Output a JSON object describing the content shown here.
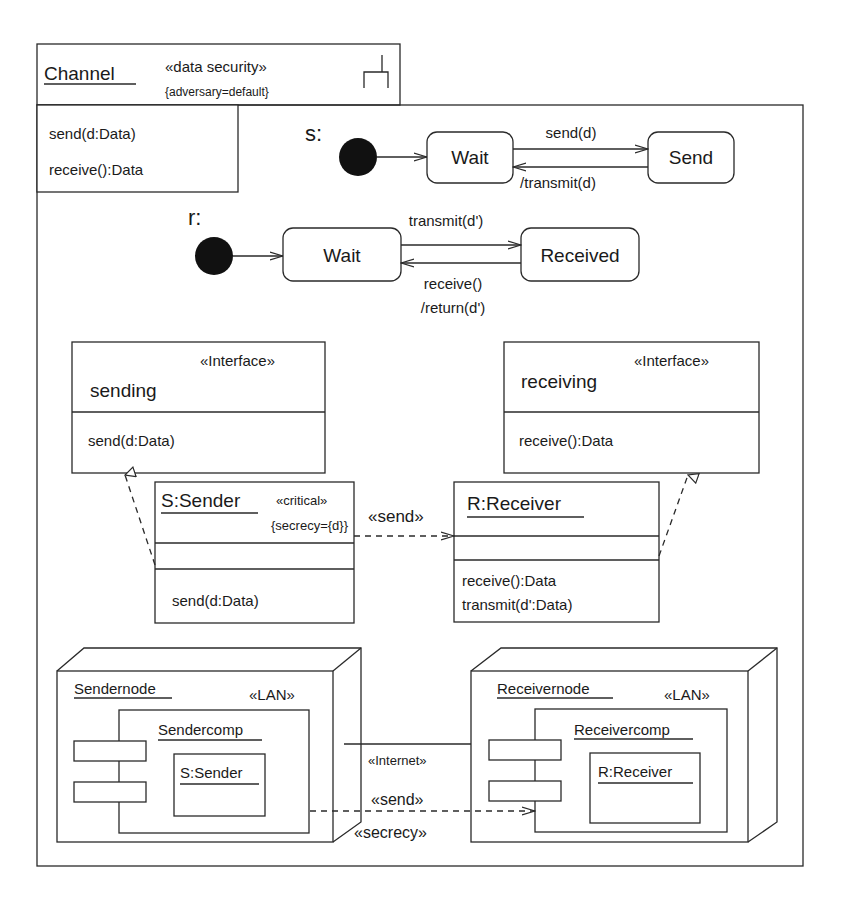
{
  "package": {
    "name": "Channel",
    "stereotype": "«data security»",
    "tag": "{adversary=default}",
    "icon": "subsystem-fork-icon",
    "operations": [
      "send(d:Data)",
      "receive():Data"
    ]
  },
  "state_machine_sender": {
    "label": "s:",
    "states": [
      "Wait",
      "Send"
    ],
    "transition_forward": "send(d)",
    "transition_back": "/transmit(d)"
  },
  "state_machine_receiver": {
    "label": "r:",
    "states": [
      "Wait",
      "Received"
    ],
    "transition_forward": "transmit(d')",
    "transition_back_1": "receive()",
    "transition_back_2": "/return(d')"
  },
  "interfaces": {
    "sending": {
      "stereotype": "«Interface»",
      "name": "sending",
      "operation": "send(d:Data)"
    },
    "receiving": {
      "stereotype": "«Interface»",
      "name": "receiving",
      "operation": "receive():Data"
    }
  },
  "classes": {
    "sender": {
      "name": "S:Sender",
      "stereotype": "«critical»",
      "tag": "{secrecy={d}}",
      "operations": [
        "send(d:Data)"
      ]
    },
    "receiver": {
      "name": "R:Receiver",
      "operations": [
        "receive():Data",
        "transmit(d':Data)"
      ]
    },
    "dependency_label": "«send»"
  },
  "deployment": {
    "sender_node": {
      "name": "Sendernode",
      "stereotype": "«LAN»",
      "component": "Sendercomp",
      "object": "S:Sender"
    },
    "receiver_node": {
      "name": "Receivernode",
      "stereotype": "«LAN»",
      "component": "Receivercomp",
      "object": "R:Receiver"
    },
    "link_label": "«Internet»",
    "dependency_label": "«send»",
    "dependency_stereotype": "«secrecy»"
  }
}
